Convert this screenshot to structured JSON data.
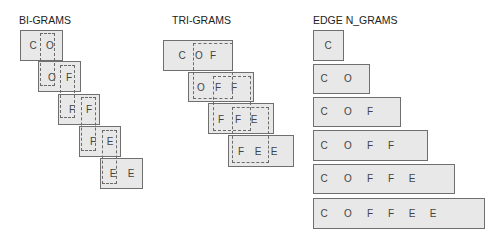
{
  "sections": {
    "bigrams": {
      "title": "BI-GRAMS",
      "grams": [
        {
          "chars": [
            "C",
            "O"
          ]
        },
        {
          "chars": [
            "O",
            "F"
          ]
        },
        {
          "chars": [
            "F",
            "F"
          ]
        },
        {
          "chars": [
            "F",
            "E"
          ]
        },
        {
          "chars": [
            "E",
            "E"
          ]
        }
      ]
    },
    "trigrams": {
      "title": "TRI-GRAMS",
      "grams": [
        {
          "chars": [
            "C",
            "O",
            "F"
          ]
        },
        {
          "chars": [
            "O",
            "F",
            "F"
          ]
        },
        {
          "chars": [
            "F",
            "F",
            "E"
          ]
        },
        {
          "chars": [
            "F",
            "E",
            "E"
          ]
        }
      ]
    },
    "edge_ngrams": {
      "title": "EDGE N_GRAMS",
      "grams": [
        {
          "chars": [
            "C"
          ]
        },
        {
          "chars": [
            "C",
            "O"
          ]
        },
        {
          "chars": [
            "C",
            "O",
            "F"
          ]
        },
        {
          "chars": [
            "C",
            "O",
            "F",
            "F"
          ]
        },
        {
          "chars": [
            "C",
            "O",
            "F",
            "F",
            "E"
          ]
        },
        {
          "chars": [
            "C",
            "O",
            "F",
            "F",
            "E",
            "E"
          ]
        }
      ]
    }
  },
  "colors": {
    "box_fill": "#e8e8e8",
    "box_border": "#6f6f6f",
    "dash_border": "#6a6a6a",
    "text": "#444444"
  }
}
